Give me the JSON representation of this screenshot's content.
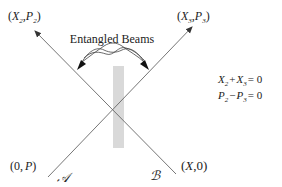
{
  "diagram": {
    "title": "Entangled Beams",
    "corners": {
      "top_left": {
        "open": "(",
        "a": "X",
        "a_sub": "2",
        "sep": ",",
        "b": "P",
        "b_sub": "2",
        "close": ")"
      },
      "top_right": {
        "open": "(",
        "a": "X",
        "a_sub": "3",
        "sep": ",",
        "b": "P",
        "b_sub": "3",
        "close": ")"
      },
      "bottom_left": {
        "open": "(",
        "a": "0",
        "sep": ",",
        "b": "P",
        "close": ")"
      },
      "bottom_right": {
        "open": "(",
        "a": "X",
        "sep": ",",
        "b": "0",
        "close": ")"
      }
    },
    "beam_labels": {
      "left": "𝒜",
      "right": "ℬ"
    },
    "equations": [
      {
        "t1": "X",
        "s1": "2",
        "op": "+",
        "t2": "X",
        "s2": "3",
        "rhs": "= 0"
      },
      {
        "t1": "P",
        "s1": "2",
        "op": "−",
        "t2": "P",
        "s2": "3",
        "rhs": "= 0"
      }
    ],
    "colors": {
      "line": "#555555",
      "beamsplitter": "#d9d9d9",
      "arrow": "#111111",
      "text": "#222222"
    }
  }
}
